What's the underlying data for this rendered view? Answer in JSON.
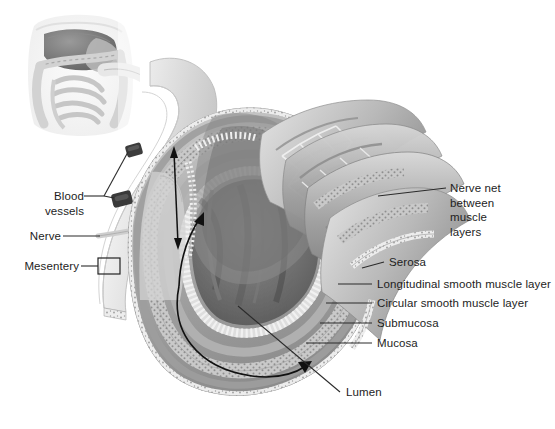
{
  "figure": {
    "background_color": "#ffffff",
    "width": 555,
    "height": 429,
    "style": "grayscale medical illustration"
  },
  "inset": {
    "name": "abdominal-anatomy-inset",
    "description": "Small orientation illustration of the abdominal cavity showing liver, stomach, small intestine and colon"
  },
  "labels": {
    "blood_vessels": "Blood\nvessels",
    "nerve": "Nerve",
    "mesentery": "Mesentery",
    "nerve_net": "Nerve net\nbetween\nmuscle\nlayers",
    "serosa": "Serosa",
    "longitudinal_muscle": "Longitudinal smooth muscle layer",
    "circular_muscle": "Circular smooth muscle layer",
    "submucosa": "Submucosa",
    "mucosa": "Mucosa",
    "lumen": "Lumen"
  },
  "colors": {
    "text": "#1d1d1d",
    "leader_line": "#2b2b2b",
    "arrow": "#111111",
    "tissue_light": "#dcdcdc",
    "tissue_mid": "#b4b4b4",
    "tissue_dark": "#7c7c7c",
    "lumen_dark": "#6b6b6b",
    "vessel": "#3a3a3a"
  }
}
